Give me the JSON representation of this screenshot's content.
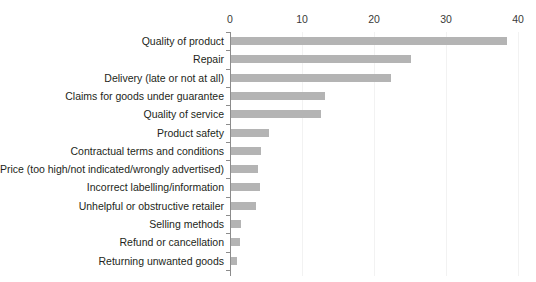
{
  "chart_data": {
    "type": "bar",
    "orientation": "horizontal",
    "title": "",
    "xlabel": "",
    "ylabel": "",
    "xlim": [
      0,
      40
    ],
    "xticks": [
      0,
      10,
      20,
      30,
      40
    ],
    "xtick_labels": [
      "0",
      "10",
      "20",
      "30",
      "40"
    ],
    "grid": true,
    "grid_axis": "x",
    "legend": false,
    "bar_color": "#b4b4b4",
    "axis_color": "#8c8c8c",
    "grid_color": "#f2f2f2",
    "label_color": "#231f20",
    "categories": [
      "Quality of product",
      "Repair",
      "Delivery (late or not at all)",
      "Claims for goods under guarantee",
      "Quality of service",
      "Product safety",
      "Contractual terms and conditions",
      "Price (too high/not indicated/wrongly advertised)",
      "Incorrect labelling/information",
      "Unhelpful or obstructive retailer",
      "Selling methods",
      "Refund or cancellation",
      "Returning unwanted goods"
    ],
    "values": [
      38.5,
      25.2,
      22.3,
      13.2,
      12.6,
      5.4,
      4.3,
      3.9,
      4.1,
      3.6,
      1.5,
      1.4,
      1.0
    ]
  }
}
